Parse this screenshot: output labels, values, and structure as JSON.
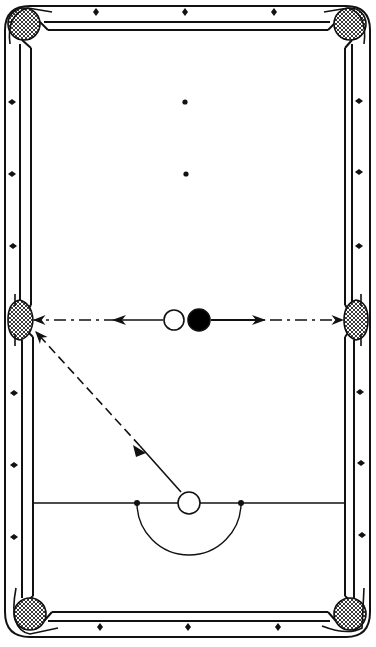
{
  "diagram": {
    "colors": {
      "ink": "#111111",
      "background": "#ffffff",
      "pocket_fill": "#555555"
    },
    "table": {
      "outer": {
        "x": 5,
        "y": 5,
        "w": 365,
        "h": 632
      },
      "inner": {
        "x": 33,
        "y": 30,
        "w": 312,
        "h": 582
      }
    },
    "diamonds": {
      "top": [
        [
          96,
          12
        ],
        [
          185,
          12
        ],
        [
          274,
          12
        ]
      ],
      "bottom": [
        [
          100,
          627
        ],
        [
          188,
          627
        ],
        [
          278,
          627
        ]
      ],
      "left": [
        [
          12,
          102
        ],
        [
          12,
          174
        ],
        [
          13,
          246
        ],
        [
          14,
          393
        ],
        [
          14,
          465
        ],
        [
          14,
          537
        ]
      ],
      "right": [
        [
          359,
          101
        ],
        [
          359,
          172
        ],
        [
          359,
          246
        ],
        [
          360,
          392
        ],
        [
          361,
          463
        ],
        [
          362,
          535
        ]
      ]
    },
    "spots": [
      [
        185,
        102
      ],
      [
        186,
        174
      ]
    ],
    "pockets": [
      {
        "name": "top-left",
        "cx": 24,
        "cy": 24
      },
      {
        "name": "top-right",
        "cx": 350,
        "cy": 24
      },
      {
        "name": "middle-left",
        "cx": 20,
        "cy": 320
      },
      {
        "name": "middle-right",
        "cx": 357,
        "cy": 320
      },
      {
        "name": "bottom-left",
        "cx": 30,
        "cy": 614
      },
      {
        "name": "bottom-right",
        "cx": 350,
        "cy": 614
      }
    ],
    "balls": [
      {
        "name": "white-object-ball",
        "cx": 174,
        "cy": 320,
        "r": 10,
        "fill": "#ffffff"
      },
      {
        "name": "black-ball",
        "cx": 199,
        "cy": 320,
        "r": 11,
        "fill": "#000000"
      },
      {
        "name": "cue-ball",
        "cx": 189,
        "cy": 503,
        "r": 11,
        "fill": "#ffffff"
      }
    ],
    "baulk_line": {
      "y": 503,
      "x1": 33,
      "x2": 345
    },
    "d_zone": {
      "cx": 189,
      "cy": 503,
      "r": 53
    },
    "d_spots": [
      [
        137,
        503
      ],
      [
        241,
        503
      ]
    ],
    "paths": [
      {
        "name": "cue-ball-path",
        "from": [
          181,
          492
        ],
        "to": [
          36,
          332
        ],
        "style": "dashed"
      },
      {
        "name": "white-ball-path",
        "from": [
          163,
          320
        ],
        "to": [
          33,
          320
        ],
        "style": "dash-dot"
      },
      {
        "name": "black-ball-path",
        "from": [
          211,
          320
        ],
        "to": [
          344,
          320
        ],
        "style": "dash-dot"
      }
    ]
  }
}
